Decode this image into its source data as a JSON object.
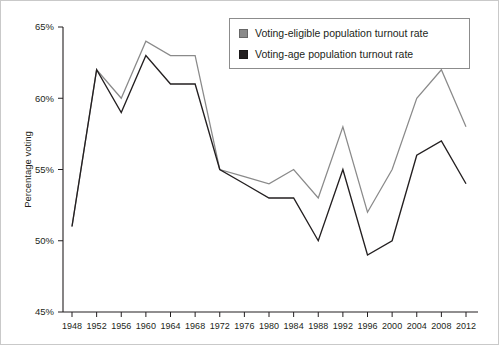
{
  "chart_data": {
    "type": "line",
    "title": "",
    "xlabel": "",
    "ylabel": "Percentage voting",
    "x": [
      1948,
      1952,
      1956,
      1960,
      1964,
      1968,
      1972,
      1976,
      1980,
      1984,
      1988,
      1992,
      1996,
      2000,
      2004,
      2008,
      2012
    ],
    "xtick_labels": [
      "1948",
      "1952",
      "1956",
      "1960",
      "1964",
      "1968",
      "1972",
      "1976",
      "1980",
      "1984",
      "1988",
      "1992",
      "1996",
      "2000",
      "2004",
      "2008",
      "2012"
    ],
    "ylim": [
      45,
      65
    ],
    "ytick_values": [
      45,
      50,
      55,
      60,
      65
    ],
    "ytick_labels": [
      "45%",
      "50%",
      "55%",
      "60%",
      "65%"
    ],
    "grid": false,
    "legend_position": "top-right",
    "series": [
      {
        "name": "Voting-eligible population turnout rate",
        "color": "#8a8a8a",
        "values": [
          51,
          62,
          60,
          64,
          63,
          63,
          55,
          54.5,
          54,
          55,
          53,
          58,
          52,
          55,
          60,
          62,
          58
        ]
      },
      {
        "name": "Voting-age population turnout rate",
        "color": "#231f20",
        "values": [
          51,
          62,
          59,
          63,
          61,
          61,
          55,
          54,
          53,
          53,
          50,
          55,
          49,
          50,
          56,
          57,
          54
        ]
      }
    ]
  },
  "legend": {
    "items": [
      {
        "label": "Voting-eligible population turnout rate",
        "color": "#8a8a8a"
      },
      {
        "label": "Voting-age population turnout rate",
        "color": "#231f20"
      }
    ]
  },
  "axes": {
    "y_axis_title": "Percentage voting"
  }
}
